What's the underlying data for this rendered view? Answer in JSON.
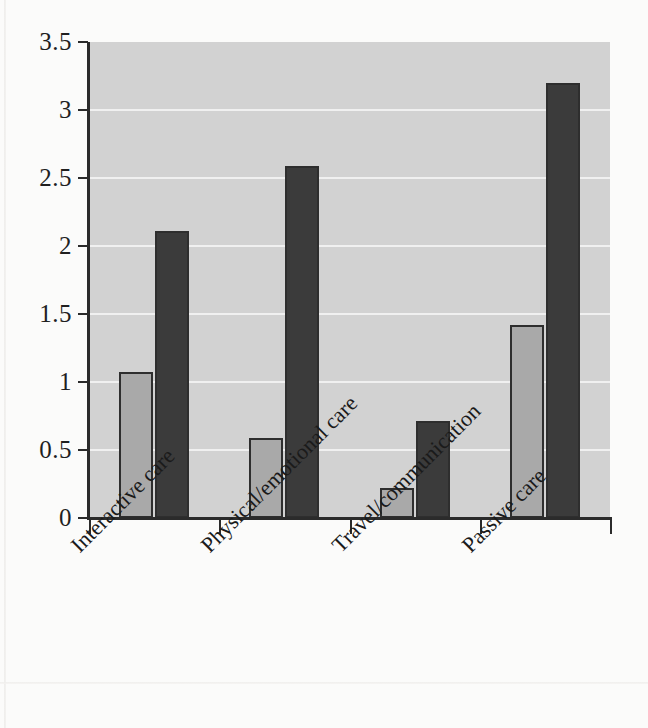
{
  "chart_data": {
    "type": "bar",
    "title": "",
    "subtitle": "",
    "xlabel": "",
    "ylabel": "",
    "categories": [
      "Interactive care",
      "Physical/emotional care",
      "Travel/communication",
      "Passive care"
    ],
    "series": [
      {
        "name": "light-gray-series",
        "color": "#a9a9a9",
        "values": [
          1.07,
          0.59,
          0.22,
          1.42
        ]
      },
      {
        "name": "dark-gray-series",
        "color": "#3b3b3b",
        "values": [
          2.11,
          2.59,
          0.71,
          3.2
        ]
      }
    ],
    "ylim": [
      0,
      3.5
    ],
    "y_ticks": [
      0,
      0.5,
      1,
      1.5,
      2,
      2.5,
      3,
      3.5
    ],
    "y_tick_labels": [
      "0",
      "0.5",
      "1",
      "1.5",
      "2",
      "2.5",
      "3",
      "3.5"
    ],
    "grid": true,
    "grid_axis": "y",
    "legend": "none",
    "legend_position": "none",
    "annotations": [],
    "plot_background": "#d2d2d2",
    "gridline_color": "#f0f0f0",
    "axis_color": "#2b2b2b",
    "figure_background": "#fbfbfa"
  }
}
